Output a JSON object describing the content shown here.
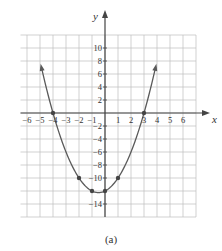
{
  "chart_data": {
    "type": "line",
    "function": "y = x^2 + x - 12",
    "title": "",
    "caption": "(a)",
    "xlabel": "x",
    "ylabel": "y",
    "xlim": [
      -6.5,
      7
    ],
    "ylim": [
      -16,
      12
    ],
    "grid": true,
    "x_ticks": [
      -6,
      -5,
      -4,
      -3,
      -2,
      -1,
      1,
      2,
      3,
      4,
      5,
      6
    ],
    "x_tick_labels": [
      "−6",
      "−5",
      "−4",
      "−3",
      "−2",
      "−1",
      "1",
      "2",
      "3",
      "4",
      "5",
      "6"
    ],
    "y_ticks": [
      10,
      8,
      6,
      4,
      2,
      -2,
      -4,
      -6,
      -8,
      -10,
      -14
    ],
    "y_tick_labels": [
      "10",
      "8",
      "6",
      "4",
      "2",
      "−2",
      "−4",
      "−6",
      "−8",
      "−10",
      "−14"
    ],
    "marked_points": [
      {
        "x": -4,
        "y": 0
      },
      {
        "x": 3,
        "y": 0
      },
      {
        "x": -2,
        "y": -10
      },
      {
        "x": -1,
        "y": -12
      },
      {
        "x": 0,
        "y": -12
      },
      {
        "x": 1,
        "y": -10
      }
    ],
    "curve_x_range": [
      -4.9,
      3.9
    ],
    "colors": {
      "curve": "#5a5a5a",
      "grid": "#bdbdbd",
      "axis": "#444444",
      "point": "#444444",
      "text": "#333333"
    }
  }
}
